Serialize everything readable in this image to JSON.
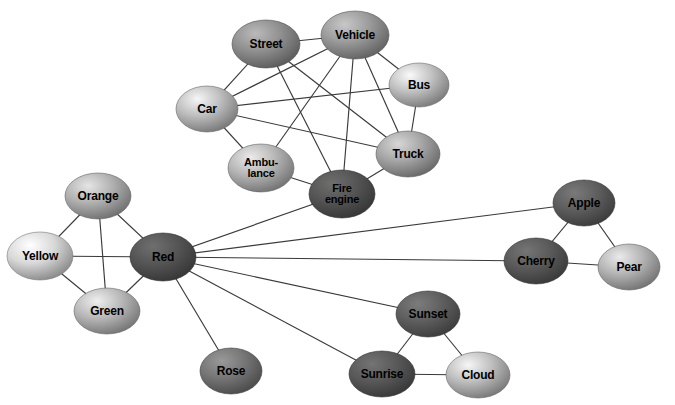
{
  "figure": {
    "type": "node-link-network-diagram",
    "background": "#ffffff",
    "width": 675,
    "height": 405,
    "edge_color": "#3a3a3a",
    "label_color": "#000000"
  },
  "chart_data": {
    "type": "network",
    "title": "",
    "nodes": [
      {
        "id": "street",
        "label": "Street",
        "x": 266,
        "y": 44,
        "rx": 34,
        "ry": 24,
        "fill": "#8f8f8f",
        "font": 12
      },
      {
        "id": "vehicle",
        "label": "Vehicle",
        "x": 355,
        "y": 35,
        "rx": 34,
        "ry": 24,
        "fill": "#9a9a9a",
        "font": 12
      },
      {
        "id": "bus",
        "label": "Bus",
        "x": 419,
        "y": 85,
        "rx": 30,
        "ry": 22,
        "fill": "#c0c0c0",
        "font": 12
      },
      {
        "id": "car",
        "label": "Car",
        "x": 207,
        "y": 109,
        "rx": 31,
        "ry": 23,
        "fill": "#bdbdbd",
        "font": 12
      },
      {
        "id": "ambulance",
        "label": "Ambu-\nlance",
        "x": 261,
        "y": 168,
        "rx": 33,
        "ry": 24,
        "fill": "#b5b5b5",
        "font": 11
      },
      {
        "id": "fire_engine",
        "label": "Fire\nengine",
        "x": 342,
        "y": 194,
        "rx": 33,
        "ry": 24,
        "fill": "#555555",
        "font": 11
      },
      {
        "id": "truck",
        "label": "Truck",
        "x": 408,
        "y": 154,
        "rx": 32,
        "ry": 23,
        "fill": "#a5a5a5",
        "font": 12
      },
      {
        "id": "orange",
        "label": "Orange",
        "x": 98,
        "y": 196,
        "rx": 33,
        "ry": 23,
        "fill": "#b0b0b0",
        "font": 12
      },
      {
        "id": "yellow",
        "label": "Yellow",
        "x": 40,
        "y": 256,
        "rx": 33,
        "ry": 24,
        "fill": "#d8d8d8",
        "font": 12
      },
      {
        "id": "red",
        "label": "Red",
        "x": 163,
        "y": 257,
        "rx": 33,
        "ry": 24,
        "fill": "#555555",
        "font": 12
      },
      {
        "id": "green",
        "label": "Green",
        "x": 107,
        "y": 311,
        "rx": 33,
        "ry": 23,
        "fill": "#b8b8b8",
        "font": 12
      },
      {
        "id": "rose",
        "label": "Rose",
        "x": 231,
        "y": 371,
        "rx": 31,
        "ry": 23,
        "fill": "#767676",
        "font": 12
      },
      {
        "id": "apple",
        "label": "Apple",
        "x": 584,
        "y": 203,
        "rx": 31,
        "ry": 23,
        "fill": "#5e5e5e",
        "font": 12
      },
      {
        "id": "cherry",
        "label": "Cherry",
        "x": 536,
        "y": 261,
        "rx": 32,
        "ry": 23,
        "fill": "#5a5a5a",
        "font": 12
      },
      {
        "id": "pear",
        "label": "Pear",
        "x": 629,
        "y": 267,
        "rx": 31,
        "ry": 23,
        "fill": "#b4b4b4",
        "font": 12
      },
      {
        "id": "sunset",
        "label": "Sunset",
        "x": 428,
        "y": 314,
        "rx": 32,
        "ry": 23,
        "fill": "#5f5f5f",
        "font": 12
      },
      {
        "id": "sunrise",
        "label": "Sunrise",
        "x": 382,
        "y": 374,
        "rx": 33,
        "ry": 23,
        "fill": "#595959",
        "font": 12
      },
      {
        "id": "cloud",
        "label": "Cloud",
        "x": 478,
        "y": 375,
        "rx": 32,
        "ry": 23,
        "fill": "#bdbdbd",
        "font": 12
      }
    ],
    "edges": [
      {
        "source": "street",
        "target": "vehicle"
      },
      {
        "source": "street",
        "target": "car"
      },
      {
        "source": "street",
        "target": "truck"
      },
      {
        "source": "street",
        "target": "fire_engine"
      },
      {
        "source": "vehicle",
        "target": "bus"
      },
      {
        "source": "vehicle",
        "target": "truck"
      },
      {
        "source": "vehicle",
        "target": "car"
      },
      {
        "source": "vehicle",
        "target": "ambulance"
      },
      {
        "source": "vehicle",
        "target": "fire_engine"
      },
      {
        "source": "bus",
        "target": "car"
      },
      {
        "source": "bus",
        "target": "truck"
      },
      {
        "source": "car",
        "target": "ambulance"
      },
      {
        "source": "car",
        "target": "truck"
      },
      {
        "source": "ambulance",
        "target": "fire_engine"
      },
      {
        "source": "truck",
        "target": "fire_engine"
      },
      {
        "source": "orange",
        "target": "yellow"
      },
      {
        "source": "orange",
        "target": "green"
      },
      {
        "source": "orange",
        "target": "red"
      },
      {
        "source": "yellow",
        "target": "red"
      },
      {
        "source": "yellow",
        "target": "green"
      },
      {
        "source": "green",
        "target": "red"
      },
      {
        "source": "red",
        "target": "fire_engine"
      },
      {
        "source": "red",
        "target": "apple"
      },
      {
        "source": "red",
        "target": "cherry"
      },
      {
        "source": "red",
        "target": "sunset"
      },
      {
        "source": "red",
        "target": "sunrise"
      },
      {
        "source": "red",
        "target": "rose"
      },
      {
        "source": "apple",
        "target": "cherry"
      },
      {
        "source": "apple",
        "target": "pear"
      },
      {
        "source": "cherry",
        "target": "pear"
      },
      {
        "source": "sunset",
        "target": "sunrise"
      },
      {
        "source": "sunset",
        "target": "cloud"
      },
      {
        "source": "sunrise",
        "target": "cloud"
      }
    ],
    "clusters": [
      {
        "name": "vehicles",
        "members": [
          "street",
          "vehicle",
          "bus",
          "car",
          "ambulance",
          "fire_engine",
          "truck"
        ]
      },
      {
        "name": "colors",
        "members": [
          "orange",
          "yellow",
          "red",
          "green",
          "rose"
        ]
      },
      {
        "name": "fruit",
        "members": [
          "apple",
          "cherry",
          "pear"
        ]
      },
      {
        "name": "sky",
        "members": [
          "sunset",
          "sunrise",
          "cloud"
        ]
      }
    ]
  }
}
